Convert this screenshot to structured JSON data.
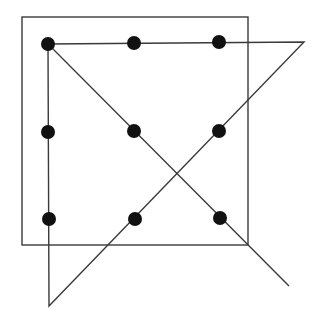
{
  "diagram": {
    "colors": {
      "background": "#ffffff",
      "stroke": "#3a3a3a",
      "dot": "#111111"
    },
    "box": {
      "x": 22,
      "y": 17,
      "width": 226,
      "height": 228
    },
    "dots": [
      {
        "x": 48,
        "y": 44
      },
      {
        "x": 134,
        "y": 43
      },
      {
        "x": 219,
        "y": 42
      },
      {
        "x": 48,
        "y": 132
      },
      {
        "x": 134,
        "y": 131
      },
      {
        "x": 219,
        "y": 131
      },
      {
        "x": 49,
        "y": 219
      },
      {
        "x": 135,
        "y": 219
      },
      {
        "x": 220,
        "y": 218
      }
    ],
    "dot_radius": 7,
    "path": [
      {
        "x": 289,
        "y": 286
      },
      {
        "x": 48,
        "y": 44
      },
      {
        "x": 304,
        "y": 42
      },
      {
        "x": 49,
        "y": 306
      },
      {
        "x": 48,
        "y": 44
      }
    ]
  }
}
